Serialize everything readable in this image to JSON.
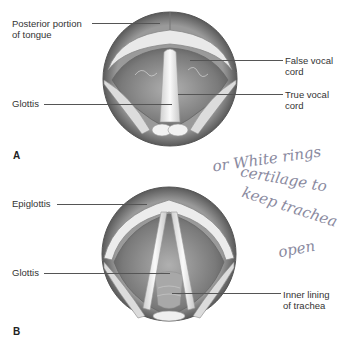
{
  "figure_a": {
    "panel_label": "A",
    "labels": {
      "posterior_tongue": "Posterior portion\nof tongue",
      "false_vocal_cord": "False vocal\ncord",
      "glottis": "Glottis",
      "true_vocal_cord": "True vocal\ncord"
    }
  },
  "figure_b": {
    "panel_label": "B",
    "labels": {
      "epiglottis": "Epiglottis",
      "glottis": "Glottis",
      "inner_lining": "Inner lining\nof trachea"
    }
  },
  "handwritten_note": {
    "line1": "or White rings",
    "line2": "certilage to",
    "line3": "keep trachea",
    "line4": "open"
  },
  "colors": {
    "tissue_dark": "#6e6e6e",
    "tissue_mid": "#9a9a9a",
    "cartilage": "#e8e8e8",
    "ink": "#8a8aa0"
  }
}
